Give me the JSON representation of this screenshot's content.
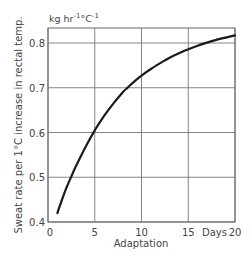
{
  "chart_data": {
    "type": "line",
    "title": "",
    "xlabel": "Adaptation",
    "xunit_label": "Days",
    "ylabel": "Sweat rate per 1°C increase in rectal temp.",
    "yunit": {
      "base": "kg hr",
      "exp1": "-1",
      "mid": "°C",
      "exp2": "-1"
    },
    "xlim": [
      0,
      20
    ],
    "ylim": [
      0.4,
      0.825
    ],
    "xticks": [
      0,
      5,
      10,
      15,
      20
    ],
    "xtick_labels": [
      "0",
      "5",
      "10",
      "15",
      "20"
    ],
    "yticks": [
      0.4,
      0.5,
      0.6,
      0.7,
      0.8
    ],
    "ytick_labels": [
      "0.4",
      "0.5",
      "0.6",
      "0.7",
      "0.8"
    ],
    "grid": true,
    "legend": "none",
    "series": [
      {
        "name": "Sweat rate",
        "x": [
          1,
          1.5,
          2,
          2.5,
          3,
          4,
          5,
          6,
          7,
          8,
          8.5,
          9,
          10,
          11,
          12,
          13,
          14,
          15,
          16,
          17,
          18,
          19,
          20
        ],
        "y": [
          0.42,
          0.45,
          0.478,
          0.502,
          0.525,
          0.567,
          0.605,
          0.637,
          0.665,
          0.69,
          0.7,
          0.71,
          0.727,
          0.742,
          0.755,
          0.767,
          0.777,
          0.786,
          0.794,
          0.801,
          0.807,
          0.812,
          0.817
        ]
      }
    ]
  }
}
